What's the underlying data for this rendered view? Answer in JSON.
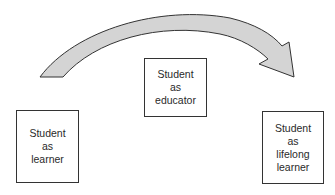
{
  "diagram": {
    "type": "progression",
    "arrow": {
      "direction": "left-to-right",
      "fill": "#d4d4d4",
      "stroke": "#333333"
    },
    "nodes": [
      {
        "id": "learner",
        "lines": [
          "Student",
          "as",
          "learner"
        ]
      },
      {
        "id": "educator",
        "lines": [
          "Student",
          "as",
          "educator"
        ]
      },
      {
        "id": "lifelong",
        "lines": [
          "Student",
          "as",
          "lifelong",
          "learner"
        ]
      }
    ]
  }
}
